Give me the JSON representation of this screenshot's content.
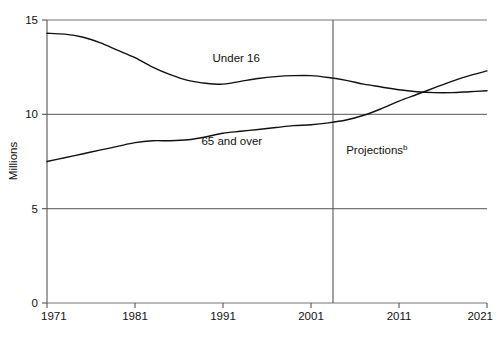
{
  "chart_data": {
    "type": "line",
    "title": "",
    "subtitle": "",
    "xlabel": "",
    "ylabel": "Millions",
    "xlim": [
      1971,
      2021
    ],
    "ylim": [
      0,
      15
    ],
    "yticks": [
      "0",
      "5",
      "10",
      "15"
    ],
    "ytick_values": [
      0,
      5,
      10,
      15
    ],
    "xticks": [
      "1971",
      "1981",
      "1991",
      "2001",
      "2011",
      "2021"
    ],
    "xtick_values": [
      1971,
      1981,
      1991,
      2001,
      2011,
      2021
    ],
    "grid": "horizontal",
    "legend": "inline-labels",
    "line_color": "#111111",
    "grid_color": "#777777",
    "axis_color": "#555555",
    "background": "#ffffff",
    "annotations": [
      {
        "name": "projections-divider",
        "text": "Projections",
        "superscript": "b",
        "x_value": 2003.5,
        "label_x_value": 2005.0,
        "label_y_value": 7.9
      }
    ],
    "series": [
      {
        "name": "Under 16",
        "label": "Under 16",
        "label_x_value": 1992.5,
        "label_y_value": 12.75,
        "x": [
          1971,
          1973,
          1975,
          1977,
          1979,
          1981,
          1983,
          1985,
          1987,
          1989,
          1991,
          1993,
          1995,
          1997,
          1999,
          2001,
          2003,
          2005,
          2007,
          2009,
          2011,
          2013,
          2015,
          2017,
          2019,
          2021
        ],
        "values": [
          14.3,
          14.25,
          14.1,
          13.8,
          13.4,
          13.0,
          12.5,
          12.1,
          11.8,
          11.65,
          11.6,
          11.75,
          11.9,
          12.0,
          12.05,
          12.05,
          11.95,
          11.8,
          11.6,
          11.45,
          11.3,
          11.2,
          11.15,
          11.15,
          11.2,
          11.25
        ]
      },
      {
        "name": "65 and over",
        "label": "65 and over",
        "label_x_value": 1992.0,
        "label_y_value": 8.35,
        "x": [
          1971,
          1973,
          1975,
          1977,
          1979,
          1981,
          1983,
          1985,
          1987,
          1989,
          1991,
          1993,
          1995,
          1997,
          1999,
          2001,
          2003,
          2005,
          2007,
          2009,
          2011,
          2013,
          2015,
          2017,
          2019,
          2021
        ],
        "values": [
          7.5,
          7.7,
          7.9,
          8.1,
          8.3,
          8.5,
          8.6,
          8.6,
          8.65,
          8.8,
          9.0,
          9.1,
          9.2,
          9.3,
          9.4,
          9.45,
          9.55,
          9.7,
          9.95,
          10.3,
          10.7,
          11.05,
          11.4,
          11.75,
          12.05,
          12.3
        ]
      }
    ]
  }
}
